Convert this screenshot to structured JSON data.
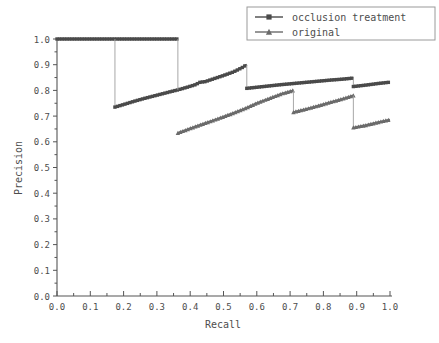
{
  "chart_data": {
    "type": "line",
    "title": "",
    "xlabel": "Recall",
    "ylabel": "Precision",
    "xlim": [
      0.0,
      1.0
    ],
    "ylim": [
      0.0,
      1.0
    ],
    "xticks": [
      "0.0",
      "0.1",
      "0.2",
      "0.3",
      "0.4",
      "0.5",
      "0.6",
      "0.7",
      "0.8",
      "0.9",
      "1.0"
    ],
    "yticks": [
      "0.0",
      "0.1",
      "0.2",
      "0.3",
      "0.4",
      "0.5",
      "0.6",
      "0.7",
      "0.8",
      "0.9",
      "1.0"
    ],
    "grid": false,
    "legend_position": "top-right",
    "series": [
      {
        "name": "occlusion treatment",
        "marker": "square",
        "color": "#4a4a4a",
        "segments": [
          {
            "note": "flat precision 1.0 plateau",
            "x": [
              0.0,
              0.04,
              0.08,
              0.12,
              0.174,
              0.22,
              0.27,
              0.32,
              0.363
            ],
            "y": [
              1.0,
              1.0,
              1.0,
              1.0,
              1.0,
              1.0,
              1.0,
              1.0,
              1.0
            ]
          },
          {
            "note": "vertical drop at recall 0.174",
            "x": [
              0.174,
              0.174
            ],
            "y": [
              1.0,
              0.735
            ]
          },
          {
            "note": "rising run from 0.174 to 0.570",
            "x": [
              0.174,
              0.2,
              0.23,
              0.26,
              0.29,
              0.32,
              0.35,
              0.363,
              0.39,
              0.415,
              0.43,
              0.445,
              0.47,
              0.5,
              0.53,
              0.555,
              0.57
            ],
            "y": [
              0.735,
              0.745,
              0.757,
              0.768,
              0.778,
              0.788,
              0.798,
              0.802,
              0.812,
              0.822,
              0.832,
              0.834,
              0.845,
              0.858,
              0.872,
              0.888,
              0.9
            ]
          },
          {
            "note": "vertical drop at recall 0.363 (plateau end)",
            "x": [
              0.363,
              0.363
            ],
            "y": [
              1.0,
              0.802
            ]
          },
          {
            "note": "vertical drop at recall 0.570",
            "x": [
              0.57,
              0.57
            ],
            "y": [
              0.9,
              0.808
            ]
          },
          {
            "note": "rising run from 0.570 to 0.890",
            "x": [
              0.57,
              0.62,
              0.67,
              0.72,
              0.77,
              0.82,
              0.86,
              0.89
            ],
            "y": [
              0.808,
              0.815,
              0.822,
              0.828,
              0.834,
              0.84,
              0.844,
              0.848
            ]
          },
          {
            "note": "vertical drop at recall 0.890",
            "x": [
              0.89,
              0.89
            ],
            "y": [
              0.848,
              0.815
            ]
          },
          {
            "note": "rising run from 0.890 to 1.000",
            "x": [
              0.89,
              0.93,
              0.965,
              1.0
            ],
            "y": [
              0.815,
              0.821,
              0.827,
              0.832
            ]
          }
        ]
      },
      {
        "name": "original",
        "marker": "triangle",
        "color": "#6b6b6b",
        "segments": [
          {
            "note": "rising run from 0.363 to 0.710",
            "x": [
              0.363,
              0.4,
              0.44,
              0.48,
              0.52,
              0.56,
              0.6,
              0.64,
              0.675,
              0.71
            ],
            "y": [
              0.634,
              0.652,
              0.67,
              0.688,
              0.707,
              0.727,
              0.75,
              0.77,
              0.787,
              0.8
            ]
          },
          {
            "note": "vertical drop at recall 0.710",
            "x": [
              0.71,
              0.71
            ],
            "y": [
              0.8,
              0.715
            ]
          },
          {
            "note": "rising run from 0.710 to 0.890",
            "x": [
              0.71,
              0.75,
              0.79,
              0.83,
              0.865,
              0.89
            ],
            "y": [
              0.715,
              0.728,
              0.742,
              0.757,
              0.77,
              0.78
            ]
          },
          {
            "note": "vertical drop at recall 0.890",
            "x": [
              0.89,
              0.89
            ],
            "y": [
              0.78,
              0.655
            ]
          },
          {
            "note": "rising run from 0.890 to 1.000",
            "x": [
              0.89,
              0.93,
              0.965,
              1.0
            ],
            "y": [
              0.655,
              0.665,
              0.676,
              0.686
            ]
          }
        ]
      }
    ]
  },
  "legend": {
    "entries": [
      {
        "label": "occlusion treatment",
        "marker": "square",
        "color": "#4a4a4a"
      },
      {
        "label": "original",
        "marker": "triangle",
        "color": "#6b6b6b"
      }
    ]
  },
  "axes": {
    "x_title": "Recall",
    "y_title": "Precision"
  }
}
